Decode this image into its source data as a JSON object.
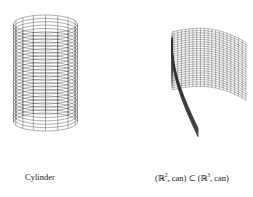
{
  "figure": {
    "panels": [
      {
        "name": "cylinder",
        "caption": "Cylinder",
        "mesh": {
          "rings": 30,
          "meridians": 16
        }
      },
      {
        "name": "folded-sheet",
        "caption_parts": {
          "open": "(",
          "r": "ℝ",
          "exp1": "2",
          "mid": ", can) ⊂ (",
          "r2": "ℝ",
          "exp2": "3",
          "close": ", can)"
        },
        "mesh": {
          "rows": 26,
          "cols": 30
        }
      }
    ],
    "line_color": "#333333"
  }
}
